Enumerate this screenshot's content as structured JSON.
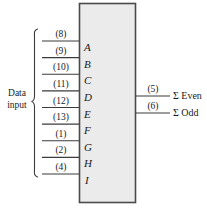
{
  "diagram": {
    "chip_body": {
      "name": "ic-body",
      "fill": "#ebebeb",
      "stroke": "#4a4a4a",
      "x": 79,
      "y": 3,
      "width": 57,
      "height": 200
    },
    "input_group": {
      "caption_line1": "Data",
      "caption_line2": "input",
      "brace": "{",
      "pins": [
        {
          "number": "(8)",
          "label": "A",
          "y": 41
        },
        {
          "number": "(9)",
          "label": "B",
          "y": 57.6
        },
        {
          "number": "(10)",
          "label": "C",
          "y": 74.3
        },
        {
          "number": "(11)",
          "label": "D",
          "y": 90.9
        },
        {
          "number": "(12)",
          "label": "E",
          "y": 107.5
        },
        {
          "number": "(13)",
          "label": "F",
          "y": 124.1
        },
        {
          "number": "(1)",
          "label": "G",
          "y": 140.8
        },
        {
          "number": "(2)",
          "label": "H",
          "y": 157.4
        },
        {
          "number": "(4)",
          "label": "I",
          "y": 174
        }
      ]
    },
    "outputs": [
      {
        "number": "(5)",
        "label": "Σ Even",
        "y": 96
      },
      {
        "number": "(6)",
        "label": "Σ Odd",
        "y": 113
      }
    ],
    "colors": {
      "line": "#3b3b3b",
      "text": "#1a1a1a",
      "body_fill": "#ebebeb",
      "background": "#ffffff"
    }
  }
}
